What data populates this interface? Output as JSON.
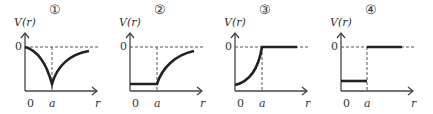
{
  "figure": {
    "panels": [
      {
        "number": "①",
        "y_label": "V(r)",
        "y_tick": "0",
        "x_ticks": [
          "0",
          "a"
        ],
        "x_label": "r",
        "description": "V decreases from 0 at r=0 to a cusp minimum at r=a, then rises back toward 0"
      },
      {
        "number": "②",
        "y_label": "V(r)",
        "y_tick": "0",
        "x_ticks": [
          "0",
          "a"
        ],
        "x_label": "r",
        "description": "V is constant negative for r<a, then rises toward 0 for r>a"
      },
      {
        "number": "③",
        "y_label": "V(r)",
        "y_tick": "0",
        "x_ticks": [
          "0",
          "a"
        ],
        "x_label": "r",
        "description": "V rises from negative at r=0 up to 0 at r=a, then stays 0 for r>a"
      },
      {
        "number": "④",
        "y_label": "V(r)",
        "y_tick": "0",
        "x_ticks": [
          "0",
          "a"
        ],
        "x_label": "r",
        "description": "V is constant negative for r<a, jumps to 0 at r=a and stays 0"
      }
    ],
    "colors": {
      "curve": "#222222",
      "axis": "#444444",
      "dashed": "#555555"
    }
  }
}
